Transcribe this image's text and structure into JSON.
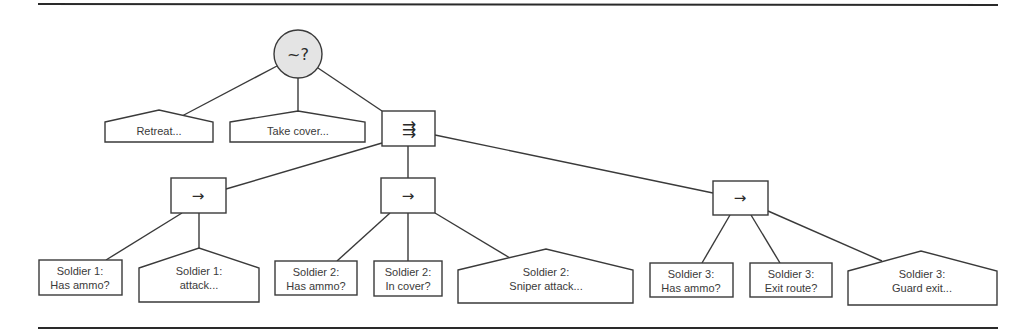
{
  "diagram": {
    "type": "behavior-tree",
    "root": {
      "symbol": "~?",
      "kind": "random-selector"
    },
    "level1": [
      {
        "kind": "action",
        "label": "Retreat..."
      },
      {
        "kind": "action",
        "label": "Take cover..."
      },
      {
        "kind": "parallel",
        "symbol": "⇶"
      }
    ],
    "sequences": [
      {
        "symbol": "→"
      },
      {
        "symbol": "→"
      },
      {
        "symbol": "→"
      }
    ],
    "leaves": {
      "s1_has_ammo": {
        "kind": "condition",
        "line1": "Soldier 1:",
        "line2": "Has ammo?"
      },
      "s1_attack": {
        "kind": "action",
        "line1": "Soldier 1:",
        "line2": "attack..."
      },
      "s2_has_ammo": {
        "kind": "condition",
        "line1": "Soldier 2:",
        "line2": "Has ammo?"
      },
      "s2_in_cover": {
        "kind": "condition",
        "line1": "Soldier 2:",
        "line2": "In cover?"
      },
      "s2_sniper": {
        "kind": "action",
        "line1": "Soldier 2:",
        "line2": "Sniper attack..."
      },
      "s3_has_ammo": {
        "kind": "condition",
        "line1": "Soldier 3:",
        "line2": "Has ammo?"
      },
      "s3_exit": {
        "kind": "condition",
        "line1": "Soldier 3:",
        "line2": "Exit route?"
      },
      "s3_guard": {
        "kind": "action",
        "line1": "Soldier 3:",
        "line2": "Guard exit..."
      }
    },
    "colors": {
      "line": "#3a3a3a",
      "root_fill": "#e4e4e4",
      "node_fill": "#ffffff"
    }
  }
}
